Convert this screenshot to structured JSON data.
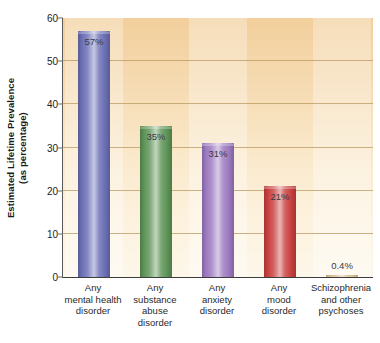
{
  "chart_data": {
    "type": "bar",
    "title": "",
    "xlabel": "",
    "ylabel_line1": "Estimated Lifetime Prevalence",
    "ylabel_line2": "(as percentage)",
    "ylim": [
      0,
      60
    ],
    "yticks": [
      0,
      10,
      20,
      30,
      40,
      50,
      60
    ],
    "ytick_labels": [
      "0",
      "10",
      "20",
      "30",
      "40",
      "50",
      "60"
    ],
    "grid": true,
    "legend": "none",
    "categories": [
      "Any mental health disorder",
      "Any substance abuse disorder",
      "Any anxiety disorder",
      "Any mood disorder",
      "Schizophrenia and other psychoses"
    ],
    "category_lines": [
      [
        "Any",
        "mental health",
        "disorder"
      ],
      [
        "Any",
        "substance",
        "abuse",
        "disorder"
      ],
      [
        "Any",
        "anxiety",
        "disorder"
      ],
      [
        "Any",
        "mood",
        "disorder"
      ],
      [
        "Schizophrenia",
        "and other",
        "psychoses"
      ]
    ],
    "values": [
      57,
      35,
      31,
      21,
      0.4
    ],
    "data_labels": [
      "57%",
      "35%",
      "31%",
      "21%",
      "0.4%"
    ],
    "colors": [
      "#6b6fb5",
      "#5e9457",
      "#9b79bf",
      "#c9403f",
      "#c9a96a"
    ],
    "plot_background_top": "#f2cf9c",
    "plot_background_bottom": "#fdf7ea",
    "gridline_color": "#b99a63",
    "axis_color": "#3c3c3c"
  }
}
